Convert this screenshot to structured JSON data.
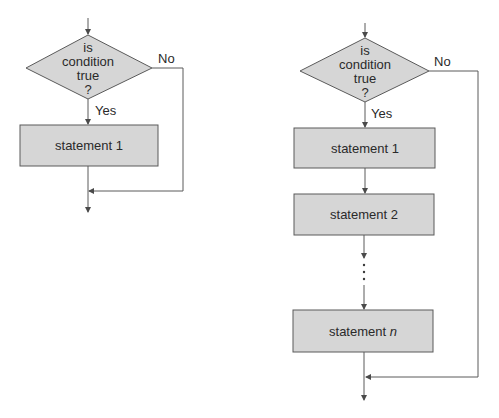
{
  "figures": [
    {
      "name": "single-statement-if",
      "decision": {
        "lines": [
          "is",
          "condition",
          "true",
          "?"
        ]
      },
      "yes_label": "Yes",
      "no_label": "No",
      "statements": [
        "statement 1"
      ]
    },
    {
      "name": "multi-statement-if",
      "decision": {
        "lines": [
          "is",
          "condition",
          "true",
          "?"
        ]
      },
      "yes_label": "Yes",
      "no_label": "No",
      "statements": [
        "statement 1",
        "statement 2",
        "statement "
      ],
      "last_statement_var": "n",
      "ellipsis": "vertical-dots"
    }
  ],
  "colors": {
    "box_fill": "#d6d6d6",
    "stroke": "#5a5a5a",
    "text": "#2a2a2a",
    "background": "#ffffff"
  }
}
